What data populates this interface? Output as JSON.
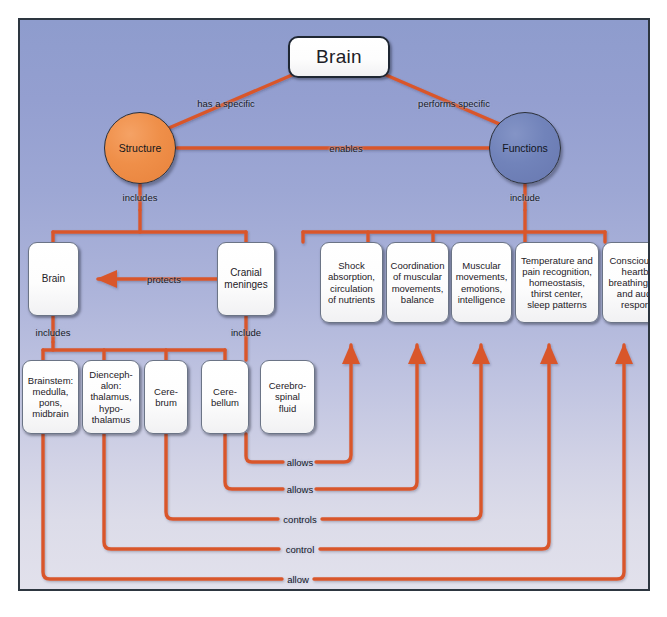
{
  "diagram": {
    "title_node": {
      "label": "Brain"
    },
    "concept_nodes": [
      {
        "id": "structure",
        "label": "Structure"
      },
      {
        "id": "functions",
        "label": "Functions"
      }
    ],
    "middle_row": [
      {
        "id": "brain2",
        "label": "Brain"
      },
      {
        "id": "cranial-meninges",
        "label": "Cranial\nmeninges"
      },
      {
        "id": "shock-absorption",
        "label": "Shock\nabsorption,\ncirculation\nof nutrients"
      },
      {
        "id": "coordination",
        "label": "Coordination\nof muscular\nmovements,\nbalance"
      },
      {
        "id": "muscular",
        "label": "Muscular\nmovements,\nemotions,\nintelligence"
      },
      {
        "id": "temperature",
        "label": "Temperature and\npain recognition,\nhomeostasis,\nthirst center,\nsleep patterns"
      },
      {
        "id": "consciousness",
        "label": "Consciousness,\nheartbeat,\nbreathing, visual\nand auditory\nresponses"
      }
    ],
    "bottom_row": [
      {
        "id": "brainstem",
        "label": "Brainstem:\nmedulla,\npons,\nmidbrain"
      },
      {
        "id": "diencephalon",
        "label": "Dienceph-\nalon:\nthalamus,\nhypo-\nthalamus"
      },
      {
        "id": "cerebrum",
        "label": "Cere-\nbrum"
      },
      {
        "id": "cerebellum",
        "label": "Cere-\nbellum"
      },
      {
        "id": "csf",
        "label": "Cerebro-\nspinal\nfluid"
      }
    ],
    "link_labels": [
      {
        "id": "has-a-specific",
        "text": "has a specific"
      },
      {
        "id": "performs-specific",
        "text": "performs specific"
      },
      {
        "id": "enables",
        "text": "enables"
      },
      {
        "id": "includes-structure",
        "text": "includes"
      },
      {
        "id": "include-functions",
        "text": "include"
      },
      {
        "id": "protects",
        "text": "protects"
      },
      {
        "id": "includes-brain",
        "text": "includes"
      },
      {
        "id": "include-meninges",
        "text": "include"
      },
      {
        "id": "allows-csf",
        "text": "allows"
      },
      {
        "id": "allows-cerebellum",
        "text": "allows"
      },
      {
        "id": "controls-cerebrum",
        "text": "controls"
      },
      {
        "id": "control-diencephalon",
        "text": "control"
      },
      {
        "id": "allow-brainstem",
        "text": "allow"
      }
    ],
    "colors": {
      "connector": "#d9572c",
      "structure_fill": "#ef8f49",
      "functions_fill": "#7183ba",
      "frame_border": "#2d3640",
      "background_top": "#8e9ccd",
      "background_bottom": "#e2e1ec",
      "node_fill": "#ffffff",
      "text": "#1d2026"
    }
  }
}
